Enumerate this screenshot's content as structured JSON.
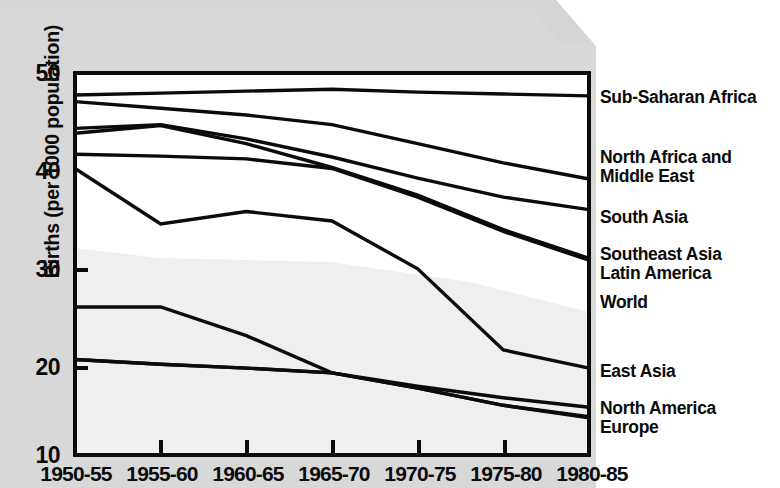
{
  "chart_data": {
    "type": "line",
    "title": "",
    "xlabel": "",
    "ylabel": "Births (per 1000 population)",
    "categories": [
      "1950-55",
      "1955-60",
      "1960-65",
      "1965-70",
      "1970-75",
      "1975-80",
      "1980-85"
    ],
    "ylim": [
      10,
      50
    ],
    "yticks": [
      10,
      20,
      30,
      40,
      50
    ],
    "grid": false,
    "legend_position": "right-of-plot",
    "series": [
      {
        "name": "Sub-Saharan Africa",
        "values": [
          47.7,
          47.9,
          48.1,
          48.3,
          48.0,
          47.8,
          47.6
        ]
      },
      {
        "name": "North Africa and Middle East",
        "values": [
          47.0,
          46.3,
          45.6,
          44.6,
          42.6,
          40.6,
          38.9
        ]
      },
      {
        "name": "South Asia",
        "values": [
          44.2,
          44.6,
          43.1,
          41.2,
          39.0,
          37.0,
          35.7
        ]
      },
      {
        "name": "Southeast Asia",
        "values": [
          43.7,
          44.5,
          42.6,
          40.1,
          37.2,
          33.6,
          30.6
        ]
      },
      {
        "name": "Latin America",
        "values": [
          41.5,
          41.3,
          41.0,
          40.0,
          37.0,
          33.4,
          30.4
        ]
      },
      {
        "name": "World",
        "values": [
          40.0,
          34.2,
          35.5,
          34.5,
          29.5,
          21.0,
          19.1
        ]
      },
      {
        "name": "East Asia",
        "values": [
          25.5,
          25.5,
          22.5,
          18.6,
          17.2,
          16.0,
          15.0
        ]
      },
      {
        "name": "North America",
        "values": [
          20.0,
          19.5,
          19.1,
          18.6,
          17.0,
          15.2,
          14.0
        ]
      },
      {
        "name": "Europe",
        "values": [
          20.0,
          19.5,
          19.1,
          18.6,
          17.0,
          15.2,
          13.9
        ]
      }
    ]
  },
  "axis": {
    "y_label": "Births (per 1000 population)",
    "y_ticks": [
      "50",
      "40",
      "30",
      "20",
      "10"
    ],
    "x_ticks": [
      "1950-55",
      "1955-60",
      "1960-65",
      "1965-70",
      "1970-75",
      "1975-80",
      "1980-85"
    ]
  },
  "labels": {
    "sub_saharan_africa": "Sub-Saharan Africa",
    "north_africa_middle_east_line1": "North Africa and",
    "north_africa_middle_east_line2": "Middle East",
    "south_asia": "South Asia",
    "southeast_asia": "Southeast Asia",
    "latin_america": "Latin America",
    "world": "World",
    "east_asia": "East Asia",
    "north_america": "North America",
    "europe": "Europe"
  },
  "colors": {
    "ink": "#0b0b0b",
    "paper": "#ffffff",
    "scan_grey": "#d9d9d9",
    "plot_shade": "#efefef"
  }
}
